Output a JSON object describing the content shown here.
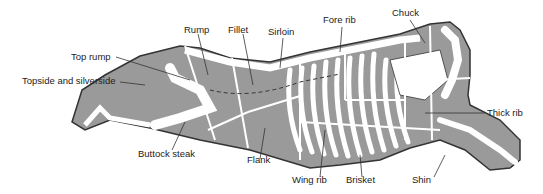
{
  "diagram": {
    "colors": {
      "meat": "#9a9a9a",
      "bone": "#ffffff",
      "outline": "#333333",
      "divider": "#ffffff",
      "text": "#222222"
    },
    "labels": {
      "rump": "Rump",
      "fillet": "Fillet",
      "sirloin": "Sirloin",
      "fore_rib": "Fore rib",
      "chuck": "Chuck",
      "top_rump": "Top rump",
      "topside_silverside": "Topside and silverside",
      "thick_rib": "Thick rib",
      "buttock_steak": "Buttock steak",
      "flank": "Flank",
      "wing_rib": "Wing rib",
      "brisket": "Brisket",
      "shin": "Shin"
    }
  }
}
